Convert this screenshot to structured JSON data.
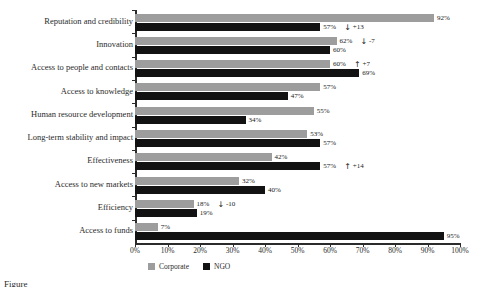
{
  "chart_data": {
    "type": "bar",
    "orientation": "horizontal",
    "title": "",
    "xlabel": "",
    "ylabel": "",
    "xlim": [
      0,
      100
    ],
    "grid": false,
    "legend_position": "bottom",
    "categories": [
      "Reputation and credibility",
      "Innovation",
      "Access to people and contacts",
      "Access to knowledge",
      "Human resource development",
      "Long-term stability and impact",
      "Effectiveness",
      "Access to new markets",
      "Efficiency",
      "Access to funds"
    ],
    "series": [
      {
        "name": "Corporate",
        "color": "#9d9d9d",
        "values": [
          92,
          62,
          60,
          57,
          55,
          53,
          42,
          32,
          18,
          7
        ]
      },
      {
        "name": "NGO",
        "color": "#121212",
        "values": [
          57,
          60,
          69,
          47,
          34,
          57,
          57,
          40,
          19,
          95
        ]
      }
    ],
    "value_labels": {
      "Corporate": [
        "92%",
        "62%",
        "60%",
        "57%",
        "55%",
        "53%",
        "42%",
        "32%",
        "18%",
        "7%"
      ],
      "NGO": [
        "57%",
        "60%",
        "69%",
        "47%",
        "34%",
        "57%",
        "57%",
        "40%",
        "19%",
        "95%"
      ]
    },
    "annotations": [
      {
        "category": "Reputation and credibility",
        "arrow": "down",
        "text": "+13"
      },
      {
        "category": "Innovation",
        "arrow": "down",
        "text": "-7"
      },
      {
        "category": "Access to people and contacts",
        "arrow": "up",
        "text": "+7"
      },
      {
        "category": "Effectiveness",
        "arrow": "up",
        "text": "+14"
      },
      {
        "category": "Efficiency",
        "arrow": "down",
        "text": "-10"
      }
    ],
    "xticks": [
      "0%",
      "10%",
      "20%",
      "30%",
      "40%",
      "50%",
      "60%",
      "70%",
      "80%",
      "90%",
      "100%"
    ],
    "xtick_values": [
      0,
      10,
      20,
      30,
      40,
      50,
      60,
      70,
      80,
      90,
      100
    ]
  },
  "legend": {
    "items": [
      {
        "label": "Corporate",
        "color": "#9d9d9d"
      },
      {
        "label": "NGO",
        "color": "#121212"
      }
    ]
  },
  "caption": {
    "text": "Figure"
  },
  "icons": {
    "arrow_up": "↑",
    "arrow_down": "↓"
  }
}
